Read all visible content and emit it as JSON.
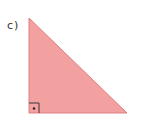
{
  "label": "c)",
  "triangle": {
    "vertices": [
      [
        29,
        18
      ],
      [
        29,
        113
      ],
      [
        127,
        113
      ]
    ],
    "fill": "#f2a0a0",
    "stroke": "#e07f82",
    "right_angle_at": [
      29,
      113
    ],
    "right_angle_marker": {
      "size": 10,
      "stroke": "#3a3a3a",
      "dot": true
    }
  }
}
